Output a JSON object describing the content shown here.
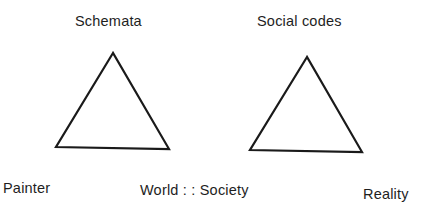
{
  "diagram": {
    "left_triangle": {
      "apex_label": "Schemata",
      "points": "113,53 56,147 169,149"
    },
    "right_triangle": {
      "apex_label": "Social codes",
      "points": "307,57 250,150 362,152"
    },
    "bottom_labels": {
      "left": "Painter",
      "center": "World : : Society",
      "right": "Reality"
    },
    "stroke_color": "#1a1a1a"
  }
}
